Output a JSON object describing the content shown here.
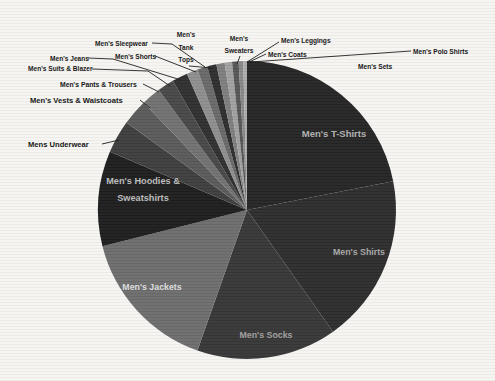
{
  "canvas": {
    "width": 495,
    "height": 381,
    "background": "#f6f5f2"
  },
  "chart_data": {
    "type": "pie",
    "title": "",
    "legend": "none",
    "start_angle_deg": 0,
    "direction": "clockwise",
    "center": {
      "cx": 247,
      "cy": 210,
      "r": 149
    },
    "slices": [
      {
        "label": "Men's T-Shirts",
        "value": 21.9,
        "color": "#252525"
      },
      {
        "label": "Men's Shirts",
        "value": 18.3,
        "color": "#2d2d2d"
      },
      {
        "label": "Men's Socks",
        "value": 15.2,
        "color": "#373737"
      },
      {
        "label": "Men's Jackets",
        "value": 15.7,
        "color": "#6d6d6d"
      },
      {
        "label": "Men's Hoodies & Sweatshirts",
        "value": 10.3,
        "color": "#1e1e1e"
      },
      {
        "label": "Mens Underwear",
        "value": 3.6,
        "color": "#3e3e3e"
      },
      {
        "label": "Men's Vests & Waistcoats",
        "value": 2.8,
        "color": "#5a5a5a"
      },
      {
        "label": "Men's Pants & Trousers",
        "value": 2.1,
        "color": "#717171"
      },
      {
        "label": "Men's Suits & Blazer",
        "value": 1.8,
        "color": "#484848"
      },
      {
        "label": "Men's Jeans",
        "value": 1.7,
        "color": "#303030"
      },
      {
        "label": "Men's Shorts",
        "value": 1.2,
        "color": "#8e8e8e"
      },
      {
        "label": "Men's Sleepwear",
        "value": 1.1,
        "color": "#696969"
      },
      {
        "label": "Men's Tank Tops",
        "value": 1.0,
        "color": "#2e2e2e"
      },
      {
        "label": "Men's Sweaters",
        "value": 0.9,
        "color": "#7e7e7e"
      },
      {
        "label": "Men's Leggings",
        "value": 0.8,
        "color": "#a0a0a0"
      },
      {
        "label": "Men's Coats",
        "value": 0.7,
        "color": "#565656"
      },
      {
        "label": "Men's Polo Shirts",
        "value": 0.5,
        "color": "#888888"
      },
      {
        "label": "Men's Sets",
        "value": 0.4,
        "color": "#ababab"
      }
    ],
    "labels": [
      {
        "slice": "Men's T-Shirts",
        "pos": "inside",
        "x": 334,
        "y": 137,
        "align": "middle",
        "lines": [
          "Men's T-Shirts"
        ],
        "size": 9.5,
        "weight": 600,
        "fill": "#b2b2b2",
        "lh": 12
      },
      {
        "slice": "Men's Shirts",
        "pos": "inside",
        "x": 359,
        "y": 255,
        "align": "middle",
        "lines": [
          "Men's Shirts"
        ],
        "size": 8.8,
        "weight": 600,
        "fill": "#a9a9a9",
        "lh": 12
      },
      {
        "slice": "Men's Socks",
        "pos": "inside",
        "x": 266,
        "y": 338,
        "align": "middle",
        "lines": [
          "Men's Socks"
        ],
        "size": 8.8,
        "weight": 600,
        "fill": "#a0a0a0",
        "lh": 12
      },
      {
        "slice": "Men's Jackets",
        "pos": "inside",
        "x": 152,
        "y": 290,
        "align": "middle",
        "lines": [
          "Men's Jackets"
        ],
        "size": 8.8,
        "weight": 600,
        "fill": "#dedede",
        "lh": 12
      },
      {
        "slice": "Men's Hoodies & Sweatshirts",
        "pos": "inside",
        "x": 143,
        "y": 184,
        "align": "middle",
        "lines": [
          "Men's Hoodies &",
          "Sweatshirts"
        ],
        "size": 9.2,
        "weight": 600,
        "fill": "#bdbdbd",
        "lh": 17
      },
      {
        "slice": "Mens Underwear",
        "pos": "outside",
        "x": 28,
        "y": 147,
        "align": "start",
        "lines": [
          "Mens Underwear"
        ],
        "size": 7.6,
        "weight": 700,
        "fill": "#141414",
        "lh": 9,
        "leader": [
          [
            102,
            144
          ],
          [
            119,
            140
          ]
        ]
      },
      {
        "slice": "Men's Vests & Waistcoats",
        "pos": "outside",
        "x": 30,
        "y": 103,
        "align": "start",
        "lines": [
          "Men's Vests & Waistcoats"
        ],
        "size": 7.6,
        "weight": 700,
        "fill": "#141414",
        "lh": 9,
        "leader": [
          [
            140,
            100
          ],
          [
            150,
            108
          ]
        ]
      },
      {
        "slice": "Men's Pants & Trousers",
        "pos": "outside",
        "x": 60,
        "y": 87,
        "align": "start",
        "lines": [
          "Men's Pants & Trousers"
        ],
        "size": 6.8,
        "weight": 700,
        "fill": "#141414",
        "lh": 8,
        "leader": [
          [
            143,
            84
          ],
          [
            159,
            92
          ]
        ]
      },
      {
        "slice": "Men's Suits & Blazer",
        "pos": "outside",
        "x": 28,
        "y": 71,
        "align": "start",
        "lines": [
          "Men's Suits & Blazer"
        ],
        "size": 6.6,
        "weight": 700,
        "fill": "#141414",
        "lh": 8,
        "leader": [
          [
            92,
            69
          ],
          [
            148,
            71
          ],
          [
            170,
            86
          ]
        ]
      },
      {
        "slice": "Men's Jeans",
        "pos": "outside",
        "x": 50,
        "y": 61,
        "align": "start",
        "lines": [
          "Men's Jeans"
        ],
        "size": 6.6,
        "weight": 700,
        "fill": "#141414",
        "lh": 8,
        "leader": [
          [
            88,
            58
          ],
          [
            113,
            59
          ],
          [
            181,
            80
          ]
        ]
      },
      {
        "slice": "Men's Shorts",
        "pos": "outside",
        "x": 115,
        "y": 59,
        "align": "start",
        "lines": [
          "Men's Shorts"
        ],
        "size": 6.6,
        "weight": 700,
        "fill": "#141414",
        "lh": 8,
        "leader": [
          [
            155,
            56
          ],
          [
            196,
            72
          ]
        ]
      },
      {
        "slice": "Men's Sleepwear",
        "pos": "outside",
        "x": 95,
        "y": 46,
        "align": "start",
        "lines": [
          "Men's Sleepwear"
        ],
        "size": 6.6,
        "weight": 700,
        "fill": "#141414",
        "lh": 8,
        "leader": [
          [
            152,
            43
          ],
          [
            172,
            44
          ],
          [
            205,
            67
          ]
        ]
      },
      {
        "slice": "Men's Tank Tops",
        "pos": "outside",
        "x": 186,
        "y": 37,
        "align": "middle",
        "lines": [
          "Men's",
          "Tank",
          "Tops"
        ],
        "size": 6.6,
        "weight": 700,
        "fill": "#141414",
        "lh": 12.5,
        "leader": [
          [
            189,
            66
          ],
          [
            212,
            68
          ]
        ]
      },
      {
        "slice": "Men's Sweaters",
        "pos": "outside",
        "x": 239,
        "y": 41,
        "align": "middle",
        "lines": [
          "Men's",
          "Sweaters"
        ],
        "size": 6.6,
        "weight": 700,
        "fill": "#141414",
        "lh": 12,
        "leader": [
          [
            240,
            56
          ],
          [
            237,
            64
          ]
        ]
      },
      {
        "slice": "Men's Leggings",
        "pos": "outside",
        "x": 281,
        "y": 43,
        "align": "start",
        "lines": [
          "Men's Leggings"
        ],
        "size": 6.6,
        "weight": 700,
        "fill": "#141414",
        "lh": 8,
        "leader": [
          [
            279,
            42
          ],
          [
            247,
            62
          ]
        ]
      },
      {
        "slice": "Men's Coats",
        "pos": "outside",
        "x": 268,
        "y": 57,
        "align": "start",
        "lines": [
          "Men's Coats"
        ],
        "size": 6.6,
        "weight": 700,
        "fill": "#141414",
        "lh": 8,
        "leader": [
          [
            266,
            54
          ],
          [
            249,
            62
          ]
        ]
      },
      {
        "slice": "Men's Polo Shirts",
        "pos": "outside",
        "x": 413,
        "y": 54,
        "align": "start",
        "lines": [
          "Men's Polo Shirts"
        ],
        "size": 6.6,
        "weight": 700,
        "fill": "#141414",
        "lh": 8,
        "leader": [
          [
            411,
            51
          ],
          [
            251,
            62
          ]
        ]
      },
      {
        "slice": "Men's Sets",
        "pos": "outside",
        "x": 358,
        "y": 69,
        "align": "start",
        "lines": [
          "Men's Sets"
        ],
        "size": 6.6,
        "weight": 700,
        "fill": "#141414",
        "lh": 8
      }
    ],
    "leader_line_color": "#1b1b1b",
    "xlabel": "",
    "ylabel": ""
  }
}
